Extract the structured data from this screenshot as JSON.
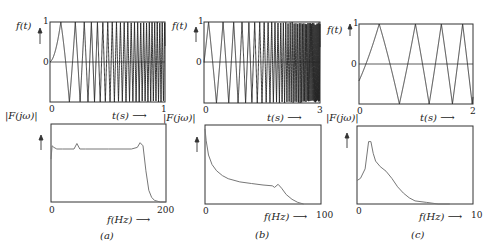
{
  "chart_data": [
    {
      "panel": "a",
      "caption": "(a)",
      "time_plot": {
        "type": "line",
        "title": "",
        "ylabel": "f(t)",
        "xlabel": "t(s)",
        "x_ticks": [
          "0",
          "1"
        ],
        "y_ticks": [
          "0",
          "1"
        ],
        "xlim": [
          0,
          1
        ],
        "ylim": [
          -1,
          1
        ],
        "description": "Linear chirp (swept-frequency signal) whose frequency increases rapidly from ~0 toward 200 Hz over 1 s"
      },
      "spectrum_plot": {
        "type": "line",
        "ylabel": "|F(jω)|",
        "xlabel": "f(Hz)",
        "x_ticks": [
          "0",
          "200"
        ],
        "xlim": [
          0,
          200
        ],
        "x": [
          0,
          2,
          5,
          10,
          20,
          40,
          45,
          50,
          60,
          100,
          140,
          150,
          155,
          160,
          165,
          170,
          175,
          180,
          190,
          200
        ],
        "values": [
          0.55,
          0.72,
          0.7,
          0.68,
          0.68,
          0.68,
          0.75,
          0.68,
          0.68,
          0.68,
          0.68,
          0.7,
          0.76,
          0.72,
          0.4,
          0.15,
          0.06,
          0.02,
          0.0,
          0.0
        ]
      }
    },
    {
      "panel": "b",
      "caption": "(b)",
      "time_plot": {
        "type": "line",
        "ylabel": "f(t)",
        "xlabel": "t(s)",
        "x_ticks": [
          "0",
          "3"
        ],
        "y_ticks": [
          "0",
          "1"
        ],
        "xlim": [
          0,
          3
        ],
        "ylim": [
          -1,
          1
        ],
        "description": "Exponential chirp with frequency increasing over 3 s"
      },
      "spectrum_plot": {
        "type": "line",
        "ylabel": "|F(jω)|",
        "xlabel": "f(Hz)",
        "x_ticks": [
          "0",
          "100"
        ],
        "xlim": [
          0,
          100
        ],
        "x": [
          0,
          1,
          3,
          6,
          10,
          15,
          20,
          30,
          40,
          50,
          58,
          60,
          63,
          66,
          70,
          75,
          80,
          85
        ],
        "values": [
          0.95,
          0.8,
          0.62,
          0.5,
          0.42,
          0.36,
          0.32,
          0.28,
          0.26,
          0.24,
          0.23,
          0.21,
          0.25,
          0.2,
          0.12,
          0.06,
          0.02,
          0.0
        ]
      }
    },
    {
      "panel": "c",
      "caption": "(c)",
      "time_plot": {
        "type": "line",
        "ylabel": "f(t)",
        "xlabel": "t(s)",
        "x_ticks": [
          "0",
          "2"
        ],
        "y_ticks": [
          "0",
          "1"
        ],
        "xlim": [
          0,
          2
        ],
        "ylim": [
          -1,
          1
        ],
        "description": "Slow chirp / triangle-like waveform with gradually increasing frequency over 2 s"
      },
      "spectrum_plot": {
        "type": "line",
        "ylabel": "|F(jω)|",
        "xlabel": "f(Hz)",
        "x_ticks": [
          "0",
          "10"
        ],
        "xlim": [
          0,
          10
        ],
        "x": [
          0,
          0.3,
          0.7,
          1.0,
          1.2,
          1.4,
          1.6,
          2.0,
          2.5,
          3.0,
          3.5,
          4.0,
          4.5,
          5.0,
          6.0,
          7.0,
          8.0
        ],
        "values": [
          0.3,
          0.33,
          0.45,
          0.8,
          0.8,
          0.65,
          0.55,
          0.48,
          0.42,
          0.33,
          0.22,
          0.14,
          0.08,
          0.04,
          0.02,
          0.0,
          0.0
        ]
      }
    }
  ],
  "labels": {
    "ft": "f(t)",
    "Fjw": "|F(jω)|",
    "ts": "t(s) ⟶",
    "fhz": "f(Hz) ⟶",
    "zero": "0",
    "one": "1",
    "a": {
      "t_end": "1",
      "f_end": "200",
      "cap": "(a)"
    },
    "b": {
      "t_end": "3",
      "f_end": "100",
      "cap": "(b)"
    },
    "c": {
      "t_end": "2",
      "f_end": "10",
      "cap": "(c)"
    }
  }
}
